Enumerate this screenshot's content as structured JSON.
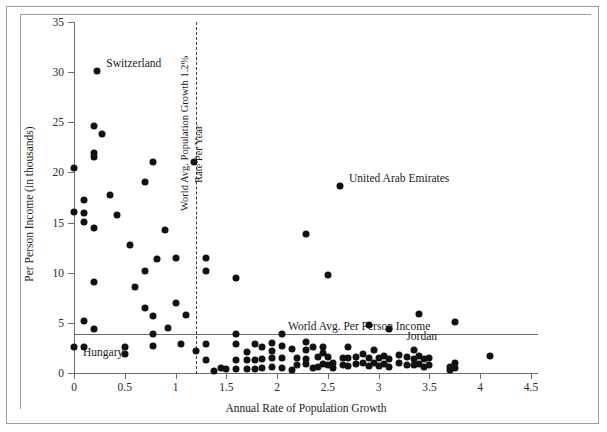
{
  "chart_data": {
    "type": "scatter",
    "title": "",
    "xlabel": "Annual Rate of Population Growth",
    "ylabel": "Per Person Income (in thousands)",
    "xlim": [
      0,
      4.5
    ],
    "ylim": [
      0,
      35
    ],
    "xticks": [
      "0",
      "0.5",
      "1",
      "1.5",
      "2",
      "2.5",
      "3",
      "3.5",
      "4",
      "4.5"
    ],
    "xtick_values": [
      0,
      0.5,
      1,
      1.5,
      2,
      2.5,
      3,
      3.5,
      4,
      4.5
    ],
    "yticks": [
      "0",
      "5",
      "10",
      "15",
      "20",
      "25",
      "30",
      "35"
    ],
    "ytick_values": [
      0,
      5,
      10,
      15,
      20,
      25,
      30,
      35
    ],
    "grid": false,
    "legend": "none",
    "reference_lines": [
      {
        "name": "world-avg-population-growth",
        "orientation": "vertical",
        "value": 1.2,
        "style": "dashed",
        "label_line1": "World Avg. Population Growth 1.2%",
        "label_line2": "Rate Per Year"
      },
      {
        "name": "world-avg-per-person-income",
        "orientation": "horizontal",
        "value": 3.9,
        "style": "solid",
        "label": "World Avg. Per Person Income"
      }
    ],
    "annotations": [
      {
        "label": "Switzerland",
        "x": 0.23,
        "y": 30.1
      },
      {
        "label": "United Arab Emirates",
        "x": 2.62,
        "y": 18.6
      },
      {
        "label": "Hungary",
        "x": 0.0,
        "y": 2.6
      },
      {
        "label": "Jordan",
        "x": 3.45,
        "y": 2.6
      }
    ],
    "points": [
      [
        0.0,
        20.4
      ],
      [
        0.0,
        16.1
      ],
      [
        0.0,
        2.6
      ],
      [
        0.1,
        17.3
      ],
      [
        0.1,
        16.0
      ],
      [
        0.1,
        15.1
      ],
      [
        0.1,
        5.2
      ],
      [
        0.1,
        2.6
      ],
      [
        0.2,
        24.6
      ],
      [
        0.2,
        21.9
      ],
      [
        0.2,
        21.5
      ],
      [
        0.2,
        9.1
      ],
      [
        0.2,
        14.5
      ],
      [
        0.2,
        4.4
      ],
      [
        0.23,
        30.1
      ],
      [
        0.28,
        23.8
      ],
      [
        0.35,
        17.7
      ],
      [
        0.42,
        15.8
      ],
      [
        0.5,
        2.6
      ],
      [
        0.5,
        1.9
      ],
      [
        0.55,
        12.8
      ],
      [
        0.6,
        8.6
      ],
      [
        0.7,
        19.0
      ],
      [
        0.7,
        10.2
      ],
      [
        0.7,
        6.5
      ],
      [
        0.78,
        21.0
      ],
      [
        0.78,
        5.7
      ],
      [
        0.78,
        3.9
      ],
      [
        0.78,
        2.7
      ],
      [
        0.82,
        11.4
      ],
      [
        0.9,
        14.3
      ],
      [
        0.93,
        4.5
      ],
      [
        1.0,
        11.5
      ],
      [
        1.0,
        7.0
      ],
      [
        1.05,
        2.9
      ],
      [
        1.1,
        5.8
      ],
      [
        1.18,
        21.0
      ],
      [
        1.2,
        2.2
      ],
      [
        1.3,
        11.5
      ],
      [
        1.3,
        10.2
      ],
      [
        1.3,
        2.9
      ],
      [
        1.3,
        1.3
      ],
      [
        1.38,
        0.2
      ],
      [
        1.45,
        0.5
      ],
      [
        1.5,
        0.4
      ],
      [
        1.6,
        9.5
      ],
      [
        1.6,
        3.9
      ],
      [
        1.6,
        2.9
      ],
      [
        1.6,
        1.3
      ],
      [
        1.6,
        0.4
      ],
      [
        1.7,
        0.4
      ],
      [
        1.7,
        2.1
      ],
      [
        1.7,
        1.3
      ],
      [
        1.78,
        0.4
      ],
      [
        1.78,
        2.9
      ],
      [
        1.78,
        1.3
      ],
      [
        1.85,
        2.6
      ],
      [
        1.85,
        1.4
      ],
      [
        1.85,
        0.5
      ],
      [
        1.95,
        3.0
      ],
      [
        1.95,
        1.5
      ],
      [
        1.95,
        0.6
      ],
      [
        1.95,
        2.2
      ],
      [
        2.05,
        3.9
      ],
      [
        2.05,
        2.7
      ],
      [
        2.05,
        1.5
      ],
      [
        2.05,
        0.5
      ],
      [
        2.15,
        2.4
      ],
      [
        2.15,
        0.3
      ],
      [
        2.2,
        1.5
      ],
      [
        2.2,
        0.8
      ],
      [
        2.28,
        13.9
      ],
      [
        2.28,
        3.1
      ],
      [
        2.28,
        2.3
      ],
      [
        2.28,
        1.4
      ],
      [
        2.28,
        0.9
      ],
      [
        2.35,
        2.6
      ],
      [
        2.35,
        0.5
      ],
      [
        2.4,
        1.6
      ],
      [
        2.4,
        0.6
      ],
      [
        2.45,
        2.6
      ],
      [
        2.45,
        2.0
      ],
      [
        2.45,
        0.9
      ],
      [
        2.5,
        9.8
      ],
      [
        2.5,
        1.6
      ],
      [
        2.5,
        0.8
      ],
      [
        2.55,
        1.0
      ],
      [
        2.55,
        0.5
      ],
      [
        2.62,
        18.6
      ],
      [
        2.65,
        0.8
      ],
      [
        2.65,
        1.5
      ],
      [
        2.7,
        2.6
      ],
      [
        2.7,
        1.5
      ],
      [
        2.7,
        0.7
      ],
      [
        2.78,
        0.9
      ],
      [
        2.78,
        1.6
      ],
      [
        2.85,
        1.0
      ],
      [
        2.85,
        1.9
      ],
      [
        2.9,
        4.8
      ],
      [
        2.9,
        0.7
      ],
      [
        2.9,
        1.5
      ],
      [
        2.95,
        1.0
      ],
      [
        2.95,
        2.3
      ],
      [
        3.0,
        1.5
      ],
      [
        3.0,
        0.7
      ],
      [
        3.05,
        1.7
      ],
      [
        3.05,
        0.9
      ],
      [
        3.1,
        4.4
      ],
      [
        3.1,
        1.4
      ],
      [
        3.1,
        0.6
      ],
      [
        3.2,
        1.0
      ],
      [
        3.2,
        1.8
      ],
      [
        3.28,
        1.6
      ],
      [
        3.28,
        0.8
      ],
      [
        3.35,
        2.3
      ],
      [
        3.35,
        1.4
      ],
      [
        3.35,
        0.8
      ],
      [
        3.4,
        5.9
      ],
      [
        3.4,
        1.7
      ],
      [
        3.4,
        0.9
      ],
      [
        3.45,
        1.4
      ],
      [
        3.45,
        0.6
      ],
      [
        3.5,
        1.5
      ],
      [
        3.5,
        0.8
      ],
      [
        3.7,
        0.6
      ],
      [
        3.7,
        0.3
      ],
      [
        3.75,
        5.1
      ],
      [
        3.75,
        1.0
      ],
      [
        3.75,
        0.5
      ],
      [
        4.1,
        1.7
      ]
    ]
  }
}
